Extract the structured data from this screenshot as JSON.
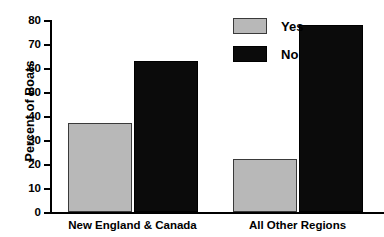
{
  "chart_data": {
    "type": "bar",
    "title": "",
    "xlabel": "",
    "ylabel": "Percent of Boats",
    "ylim": [
      0,
      80
    ],
    "yticks": [
      0,
      10,
      20,
      30,
      40,
      50,
      60,
      70,
      80
    ],
    "ytick_labels": [
      "0",
      "10",
      "20",
      "30",
      "40",
      "50",
      "60",
      "70",
      "80"
    ],
    "grid": false,
    "legend_position": "top-right",
    "categories": [
      "New England & Canada",
      "All Other Regions"
    ],
    "series": [
      {
        "name": "Yes",
        "color": "#b8b8b8",
        "values": [
          37,
          22
        ]
      },
      {
        "name": "No",
        "color": "#0b0b0b",
        "values": [
          63,
          78
        ]
      }
    ]
  },
  "legend": {
    "items": [
      {
        "label": "Yes",
        "swatch": "gray-swatch"
      },
      {
        "label": "No",
        "swatch": "black-swatch"
      }
    ]
  },
  "axes": {
    "y_title": "Percent of Boats"
  }
}
